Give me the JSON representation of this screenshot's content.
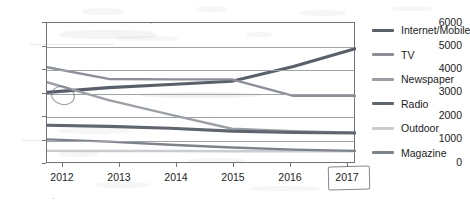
{
  "chart_data": {
    "type": "line",
    "title": "",
    "subtitle": "",
    "xlabel": "",
    "ylabel": "",
    "categories": [
      "2012",
      "2013",
      "2014",
      "2015",
      "2016",
      "2017"
    ],
    "x": [
      2012,
      2013,
      2014,
      2015,
      2016,
      2017
    ],
    "ylim": [
      0,
      6000
    ],
    "ytick_values": [
      0,
      1000,
      2000,
      3000,
      4000,
      5000,
      6000
    ],
    "ytick_labels": [
      "0",
      "1000",
      "2000",
      "3000",
      "4000",
      "5000",
      "6000"
    ],
    "grid": true,
    "grid_axis": "y",
    "legend_position": "right",
    "series": [
      {
        "name": "Internet/Mobile",
        "color": "#58606b",
        "values": [
          3050,
          3250,
          3380,
          3520,
          4150,
          4900
        ]
      },
      {
        "name": "TV",
        "color": "#8b9098",
        "values": [
          4120,
          3620,
          3600,
          3600,
          2900,
          2900
        ]
      },
      {
        "name": "Newspaper",
        "color": "#9ba0a7",
        "values": [
          3480,
          2720,
          2100,
          1500,
          1400,
          1330
        ]
      },
      {
        "name": "Radio",
        "color": "#5f666f",
        "values": [
          1650,
          1600,
          1520,
          1400,
          1340,
          1320
        ]
      },
      {
        "name": "Outdoor",
        "color": "#c9ccd1",
        "values": [
          560,
          555,
          550,
          545,
          545,
          545
        ]
      },
      {
        "name": "Magazine",
        "color": "#7d838b",
        "values": [
          1050,
          950,
          820,
          700,
          610,
          560
        ]
      }
    ],
    "annotations": [
      {
        "name": "hand-drawn-circle",
        "target": "Internet/Mobile 2012 data point"
      },
      {
        "name": "hand-drawn-box",
        "target": "2017 x-axis label"
      }
    ]
  },
  "axis": {
    "y_labels": [
      "6000",
      "5000",
      "4000",
      "3000",
      "2000",
      "1000",
      "0"
    ],
    "x_labels": [
      "2012",
      "2013",
      "2014",
      "2015",
      "2016",
      "2017"
    ]
  },
  "legend": {
    "items": [
      {
        "label": "Internet/Mobile",
        "color": "#58606b"
      },
      {
        "label": "TV",
        "color": "#8b9098"
      },
      {
        "label": "Newspaper",
        "color": "#9ba0a7"
      },
      {
        "label": "Radio",
        "color": "#5f666f"
      },
      {
        "label": "Outdoor",
        "color": "#c9ccd1"
      },
      {
        "label": "Magazine",
        "color": "#7d838b"
      }
    ]
  }
}
